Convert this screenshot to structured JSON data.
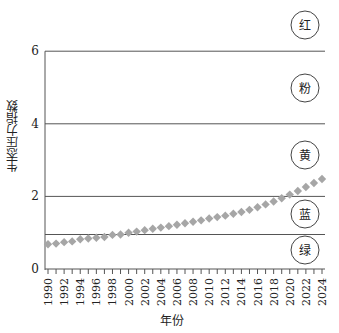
{
  "chart_data": {
    "type": "scatter",
    "title": "",
    "xlabel": "年份",
    "ylabel": "生态压力指数",
    "ylim": [
      0,
      6
    ],
    "yticks": [
      0,
      2,
      4,
      6
    ],
    "xlim": [
      1990,
      2024
    ],
    "xticks": [
      1990,
      1992,
      1994,
      1996,
      1998,
      2000,
      2002,
      2004,
      2006,
      2008,
      2010,
      2012,
      2014,
      2016,
      2018,
      2020,
      2022,
      2024
    ],
    "grid": false,
    "threshold_lines": [
      0.95,
      2,
      4,
      6
    ],
    "zones": [
      {
        "label": "绿",
        "from": 0,
        "to": 0.95
      },
      {
        "label": "蓝",
        "from": 0.95,
        "to": 2
      },
      {
        "label": "黄",
        "from": 2,
        "to": 4
      },
      {
        "label": "粉",
        "from": 4,
        "to": 6
      },
      {
        "label": "红",
        "from": 6,
        "to": null
      }
    ],
    "series": [
      {
        "name": "生态压力指数",
        "marker": "diamond",
        "color": "#a6a6a6",
        "x": [
          1990,
          1991,
          1992,
          1993,
          1994,
          1995,
          1996,
          1997,
          1998,
          1999,
          2000,
          2001,
          2002,
          2003,
          2004,
          2005,
          2006,
          2007,
          2008,
          2009,
          2010,
          2011,
          2012,
          2013,
          2014,
          2015,
          2016,
          2017,
          2018,
          2019,
          2020,
          2021,
          2022,
          2023,
          2024
        ],
        "values": [
          0.68,
          0.7,
          0.74,
          0.76,
          0.82,
          0.84,
          0.86,
          0.88,
          0.94,
          0.95,
          1.0,
          1.03,
          1.07,
          1.11,
          1.14,
          1.18,
          1.22,
          1.26,
          1.3,
          1.34,
          1.39,
          1.43,
          1.47,
          1.52,
          1.57,
          1.63,
          1.7,
          1.78,
          1.86,
          1.95,
          2.05,
          2.15,
          2.26,
          2.37,
          2.48
        ]
      }
    ]
  }
}
